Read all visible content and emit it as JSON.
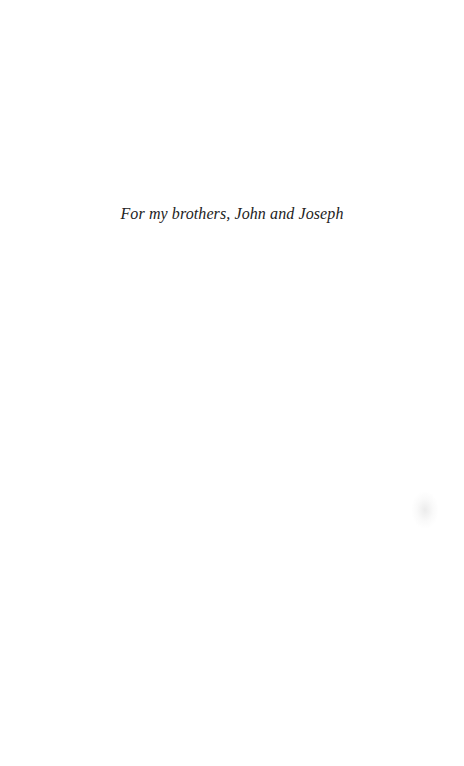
{
  "page": {
    "type": "dedication",
    "text": "For my brothers, John and Joseph"
  }
}
